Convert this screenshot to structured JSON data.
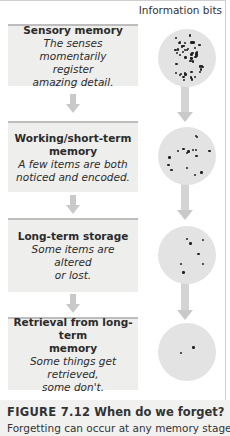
{
  "header": {
    "label": "Information bits"
  },
  "stages": [
    {
      "title": "Sensory memory",
      "description": "The senses momentarily register amazing detail.",
      "desc_lines": [
        "The senses momentarily",
        "register",
        "amazing detail."
      ],
      "dot_count": 50
    },
    {
      "title": "Working/short-term memory",
      "title_lines": [
        "Working/short-term",
        "memory"
      ],
      "description": "A few items are both noticed and encoded.",
      "desc_lines": [
        "A few items are both",
        "noticed and encoded."
      ],
      "dot_count": 16
    },
    {
      "title": "Long-term storage",
      "description": "Some items are altered or lost.",
      "desc_lines": [
        "Some items are altered",
        "or lost."
      ],
      "dot_count": 7
    },
    {
      "title": "Retrieval from long-term memory",
      "title_lines": [
        "Retrieval from long-term",
        "memory"
      ],
      "description": "Some things get retrieved, some don't.",
      "desc_lines": [
        "Some things get",
        "retrieved,",
        "some don't."
      ],
      "dot_count": 2
    }
  ],
  "caption": {
    "figure_number": "FIGURE 7.12",
    "title": "When do we forget?",
    "text": "Forgetting can occur at any memory stage."
  },
  "colors": {
    "stage_bg": "#eeeeec",
    "stage_border": "#bdbdbd",
    "arrow": "#c9c9c9",
    "circle": "#e3e3e3",
    "dot": "#222222",
    "caption_bg": "#f1f1f0"
  }
}
